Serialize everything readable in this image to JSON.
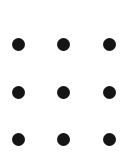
{
  "figure": {
    "name": "three-by-three-dot-grid",
    "width": 136,
    "height": 158,
    "background_color": "#ffffff",
    "dot_color": "#151515",
    "dot_diameter": 13,
    "rows": 3,
    "columns": 3,
    "column_centers_x": [
      18,
      63,
      109
    ],
    "row_centers_y": [
      44,
      92,
      139
    ]
  },
  "chart_data": {
    "type": "scatter",
    "title": "",
    "xlabel": "",
    "ylabel": "",
    "xlim": [
      0,
      136
    ],
    "ylim": [
      0,
      158
    ],
    "grid": false,
    "legend": null,
    "marker": "filled-circle",
    "marker_size": 13,
    "marker_color": "#151515",
    "series": [
      {
        "name": "dot-grid",
        "points": [
          {
            "id": "dot-r1-c1",
            "x": 18,
            "y": 44
          },
          {
            "id": "dot-r1-c2",
            "x": 63,
            "y": 44
          },
          {
            "id": "dot-r1-c3",
            "x": 109,
            "y": 44
          },
          {
            "id": "dot-r2-c1",
            "x": 18,
            "y": 92
          },
          {
            "id": "dot-r2-c2",
            "x": 63,
            "y": 92
          },
          {
            "id": "dot-r2-c3",
            "x": 109,
            "y": 92
          },
          {
            "id": "dot-r3-c1",
            "x": 18,
            "y": 139
          },
          {
            "id": "dot-r3-c2",
            "x": 63,
            "y": 139
          },
          {
            "id": "dot-r3-c3",
            "x": 109,
            "y": 139
          }
        ]
      }
    ]
  }
}
